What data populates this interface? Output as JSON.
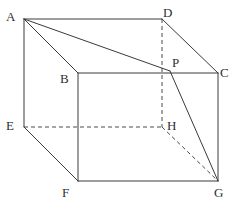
{
  "figure": {
    "kind": "geometry-diagram",
    "shape_name": "cuboid",
    "canvas": {
      "width": 232,
      "height": 203,
      "background": "#ffffff"
    },
    "style": {
      "solid_stroke": "#3a3a3a",
      "dashed_stroke": "#4a4a4a",
      "stroke_width": 1,
      "label_color": "#2f2f2f",
      "dash_pattern": "4 3"
    },
    "vertices": [
      {
        "id": "A",
        "label": "A",
        "x": 24,
        "y": 19,
        "label_x": 6,
        "label_y": 10,
        "hidden": false
      },
      {
        "id": "B",
        "label": "B",
        "x": 78,
        "y": 73,
        "label_x": 60,
        "label_y": 72,
        "hidden": false
      },
      {
        "id": "C",
        "label": "C",
        "x": 218,
        "y": 73,
        "label_x": 220,
        "label_y": 66,
        "hidden": false
      },
      {
        "id": "D",
        "label": "D",
        "x": 162,
        "y": 19,
        "label_x": 163,
        "label_y": 6,
        "hidden": false
      },
      {
        "id": "E",
        "label": "E",
        "x": 24,
        "y": 127,
        "label_x": 6,
        "label_y": 119,
        "hidden": false
      },
      {
        "id": "F",
        "label": "F",
        "x": 78,
        "y": 181,
        "label_x": 62,
        "label_y": 186,
        "hidden": false
      },
      {
        "id": "G",
        "label": "G",
        "x": 218,
        "y": 181,
        "label_x": 214,
        "label_y": 186,
        "hidden": false
      },
      {
        "id": "H",
        "label": "H",
        "x": 162,
        "y": 127,
        "label_x": 167,
        "label_y": 119,
        "hidden": true
      },
      {
        "id": "P",
        "label": "P",
        "x": 170,
        "y": 71,
        "label_x": 172,
        "label_y": 56,
        "hidden": false
      }
    ],
    "edges_solid": [
      {
        "from": "A",
        "to": "D",
        "x1": 24,
        "y1": 19,
        "x2": 162,
        "y2": 19
      },
      {
        "from": "A",
        "to": "B",
        "x1": 24,
        "y1": 19,
        "x2": 78,
        "y2": 73
      },
      {
        "from": "A",
        "to": "E",
        "x1": 24,
        "y1": 19,
        "x2": 24,
        "y2": 127
      },
      {
        "from": "A",
        "to": "P",
        "x1": 24,
        "y1": 19,
        "x2": 170,
        "y2": 71
      },
      {
        "from": "D",
        "to": "C",
        "x1": 162,
        "y1": 19,
        "x2": 218,
        "y2": 73
      },
      {
        "from": "B",
        "to": "C",
        "x1": 78,
        "y1": 73,
        "x2": 218,
        "y2": 73
      },
      {
        "from": "B",
        "to": "F",
        "x1": 78,
        "y1": 73,
        "x2": 78,
        "y2": 181
      },
      {
        "from": "C",
        "to": "G",
        "x1": 218,
        "y1": 73,
        "x2": 218,
        "y2": 181
      },
      {
        "from": "E",
        "to": "F",
        "x1": 24,
        "y1": 127,
        "x2": 78,
        "y2": 181
      },
      {
        "from": "F",
        "to": "G",
        "x1": 78,
        "y1": 181,
        "x2": 218,
        "y2": 181
      },
      {
        "from": "P",
        "to": "G",
        "x1": 170,
        "y1": 71,
        "x2": 218,
        "y2": 181
      }
    ],
    "edges_dashed": [
      {
        "from": "D",
        "to": "H",
        "x1": 162,
        "y1": 19,
        "x2": 162,
        "y2": 127
      },
      {
        "from": "E",
        "to": "H",
        "x1": 24,
        "y1": 127,
        "x2": 162,
        "y2": 127
      },
      {
        "from": "H",
        "to": "G",
        "x1": 162,
        "y1": 127,
        "x2": 218,
        "y2": 181
      }
    ]
  }
}
